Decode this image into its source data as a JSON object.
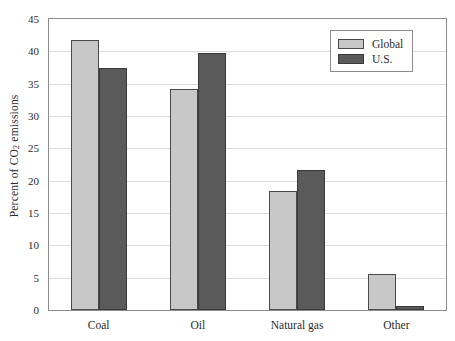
{
  "chart_data": {
    "type": "bar",
    "title": "",
    "xlabel": "",
    "ylabel": "Percent of CO2 emissions",
    "ylabel_parts": {
      "pre": "Percent of CO",
      "sub": "2",
      "post": " emissions"
    },
    "categories": [
      "Coal",
      "Oil",
      "Natural gas",
      "Other"
    ],
    "series": [
      {
        "name": "Global",
        "color": "#c8c8c8",
        "values": [
          41.7,
          34.2,
          18.4,
          5.5
        ]
      },
      {
        "name": "U.S.",
        "color": "#5a5a5a",
        "values": [
          37.4,
          39.7,
          21.6,
          0.7
        ]
      }
    ],
    "ylim": [
      0,
      45
    ],
    "ytick_values": [
      0,
      5,
      10,
      15,
      20,
      25,
      30,
      35,
      40,
      45
    ],
    "ytick_labels": [
      "0",
      "5",
      "10",
      "15",
      "20",
      "25",
      "30",
      "35",
      "40",
      "45"
    ],
    "grid": true,
    "grid_axis": "y",
    "legend_position": "top-right",
    "frame_color": "#8c8c8c",
    "grid_color": "#dcdcdc",
    "background": "#ffffff"
  }
}
